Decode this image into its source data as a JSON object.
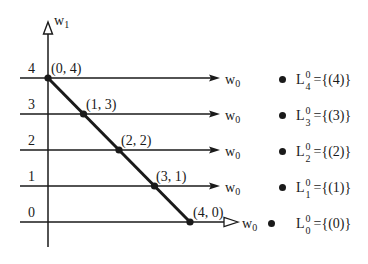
{
  "diagram": {
    "vertical_axis": {
      "label_main": "w",
      "label_sub": "1"
    },
    "horizontal_axis": {
      "label_main": "w",
      "label_sub": "0"
    },
    "levels": [
      {
        "value": "4",
        "point": "(0, 4)",
        "axis_main": "w",
        "axis_sub": "0",
        "set_main": "L",
        "set_sup": "0",
        "set_sub": "4",
        "set_value": "={(4)}"
      },
      {
        "value": "3",
        "point": "(1, 3)",
        "axis_main": "w",
        "axis_sub": "0",
        "set_main": "L",
        "set_sup": "0",
        "set_sub": "3",
        "set_value": "={(3)}"
      },
      {
        "value": "2",
        "point": "(2, 2)",
        "axis_main": "w",
        "axis_sub": "0",
        "set_main": "L",
        "set_sup": "0",
        "set_sub": "2",
        "set_value": "={(2)}"
      },
      {
        "value": "1",
        "point": "(3, 1)",
        "axis_main": "w",
        "axis_sub": "0",
        "set_main": "L",
        "set_sup": "0",
        "set_sub": "1",
        "set_value": "={(1)}"
      },
      {
        "value": "0",
        "point": "(4, 0)",
        "axis_main": "w",
        "axis_sub": "0",
        "set_main": "L",
        "set_sup": "0",
        "set_sub": "0",
        "set_value": "={(0)}"
      }
    ],
    "colors": {
      "line": "#1a1a1a",
      "background": "#ffffff"
    }
  }
}
